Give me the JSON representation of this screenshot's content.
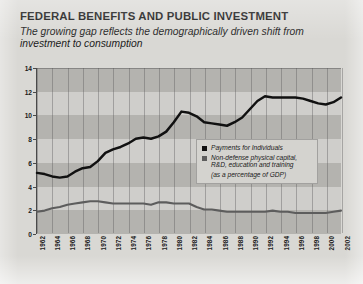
{
  "figure": {
    "title": "FEDERAL BENEFITS AND PUBLIC INVESTMENT",
    "subtitle": "The growing gap reflects the demographically driven shift from investment to consumption"
  },
  "legend": {
    "series1_label": "Payments for Individuals",
    "series2_label": "Non-defense physical capital, R&D, education and training",
    "note": "(as a percentage of GDP)",
    "series1_color": "#111111",
    "series2_color": "#5d5d5d"
  },
  "chart_data": {
    "type": "line",
    "title": "FEDERAL BENEFITS AND PUBLIC INVESTMENT",
    "subtitle": "The growing gap reflects the demographically driven shift from investment to consumption",
    "xlabel": "",
    "ylabel": "",
    "ylim": [
      0,
      14
    ],
    "yticks": [
      0,
      2,
      4,
      6,
      8,
      10,
      12,
      14
    ],
    "grid": true,
    "legend_position": "inside-right",
    "units": "percent of GDP",
    "x": [
      1962,
      1963,
      1964,
      1965,
      1966,
      1967,
      1968,
      1969,
      1970,
      1971,
      1972,
      1973,
      1974,
      1975,
      1976,
      1977,
      1978,
      1979,
      1980,
      1981,
      1982,
      1983,
      1984,
      1985,
      1986,
      1987,
      1988,
      1989,
      1990,
      1991,
      1992,
      1993,
      1994,
      1995,
      1996,
      1997,
      1998,
      1999,
      2000,
      2001,
      2002
    ],
    "xticks": [
      1962,
      1964,
      1966,
      1968,
      1970,
      1972,
      1974,
      1976,
      1978,
      1980,
      1982,
      1984,
      1986,
      1988,
      1990,
      1992,
      1994,
      1996,
      1998,
      2000,
      2002
    ],
    "series": [
      {
        "name": "Payments for Individuals",
        "color": "#111111",
        "values": [
          5.1,
          5.0,
          4.8,
          4.7,
          4.8,
          5.2,
          5.5,
          5.6,
          6.1,
          6.8,
          7.1,
          7.3,
          7.6,
          8.0,
          8.1,
          8.0,
          8.2,
          8.6,
          9.4,
          10.3,
          10.2,
          9.9,
          9.4,
          9.3,
          9.2,
          9.1,
          9.4,
          9.8,
          10.5,
          11.2,
          11.6,
          11.5,
          11.5,
          11.5,
          11.5,
          11.4,
          11.2,
          11.0,
          10.9,
          11.1,
          11.5
        ]
      },
      {
        "name": "Non-defense physical capital, R&D, education and training",
        "color": "#5d5d5d",
        "values": [
          1.8,
          1.9,
          2.1,
          2.2,
          2.4,
          2.5,
          2.6,
          2.7,
          2.7,
          2.6,
          2.5,
          2.5,
          2.5,
          2.5,
          2.5,
          2.4,
          2.6,
          2.6,
          2.5,
          2.5,
          2.5,
          2.2,
          2.0,
          2.0,
          1.9,
          1.8,
          1.8,
          1.8,
          1.8,
          1.8,
          1.8,
          1.9,
          1.8,
          1.8,
          1.7,
          1.7,
          1.7,
          1.7,
          1.7,
          1.8,
          1.9
        ]
      }
    ]
  }
}
